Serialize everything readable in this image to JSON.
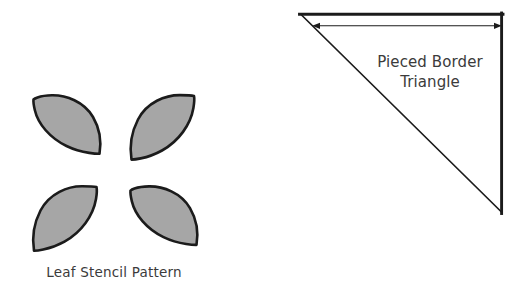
{
  "figure": {
    "background_color": "#ffffff",
    "panels": [
      {
        "id": "leaf-stencil-panel",
        "caption": "Leaf Stencil Pattern"
      },
      {
        "id": "pieced-border-panel",
        "label_line_1": "Pieced Border",
        "label_line_2": "Triangle"
      }
    ]
  },
  "leaf_stencil": {
    "caption": "Leaf Stencil Pattern",
    "fill_color": "#a6a6a6",
    "stroke_color": "#1b1b1b",
    "petal_count": 4,
    "petals": [
      {
        "name": "petal-top-left",
        "orientation": "tip-lower-right"
      },
      {
        "name": "petal-top-right",
        "orientation": "tip-lower-left"
      },
      {
        "name": "petal-bottom-left",
        "orientation": "tip-lower-left"
      },
      {
        "name": "petal-bottom-right",
        "orientation": "tip-lower-right"
      }
    ]
  },
  "pieced_border": {
    "label_line_1": "Pieced Border",
    "label_line_2": "Triangle",
    "stroke_color": "#1b1b1b",
    "fill_color": "#ffffff",
    "dimension_arrow": {
      "name": "width-dimension-arrow",
      "style": "double-headed",
      "orientation": "horizontal"
    },
    "triangle": {
      "type": "right-triangle",
      "vertices": "top-left, top-right, bottom-right"
    }
  }
}
